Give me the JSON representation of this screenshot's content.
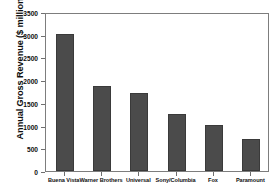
{
  "top_clip_text": "",
  "chart_data": {
    "type": "bar",
    "title": "",
    "xlabel": "",
    "ylabel": "Annual Gross Revenue ($ millions)",
    "ylim": [
      0,
      3500
    ],
    "yticks": [
      0,
      500,
      1000,
      1500,
      2000,
      2500,
      3000,
      3500
    ],
    "ytick_labels": [
      "0",
      "500",
      "1000",
      "1500",
      "2000",
      "2500",
      "3000",
      "3500"
    ],
    "grid": false,
    "legend": false,
    "bar_color": "#4b4b4b",
    "categories": [
      "Buena Vista",
      "Warner Brothers",
      "Universal",
      "Sony/Columbia",
      "Fox",
      "Paramount"
    ],
    "values": [
      3060,
      1910,
      1760,
      1300,
      1060,
      750
    ]
  }
}
